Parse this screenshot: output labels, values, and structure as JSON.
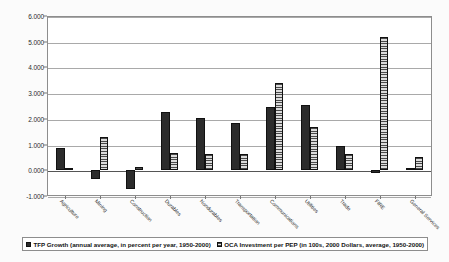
{
  "chart_data": {
    "type": "bar",
    "title": "",
    "subtitle": "",
    "xlabel": "",
    "ylabel": "",
    "ylim": [
      -1.0,
      6.0
    ],
    "ytick_values": [
      6.0,
      5.0,
      4.0,
      3.0,
      2.0,
      1.0,
      0.0,
      -1.0
    ],
    "ytick_labels": [
      "6.000",
      "5.000",
      "4.000",
      "3.000",
      "2.000",
      "1.000",
      "0.000",
      "-1.000"
    ],
    "grid": true,
    "legend_position": "bottom",
    "categories": [
      "Agriculture",
      "Mining",
      "Construction",
      "Durables",
      "Nondurables",
      "Transportation",
      "Communications",
      "Utilities",
      "Trade",
      "FIRE",
      "General Services"
    ],
    "series": [
      {
        "name": "TFP Growth (annual average, in percent per year, 1950-2000)",
        "key": "tfp",
        "color": "#2c2c2c",
        "values": [
          0.88,
          -0.34,
          -0.72,
          2.28,
          2.05,
          1.84,
          2.48,
          2.55,
          0.94,
          -0.1,
          0.09
        ]
      },
      {
        "name": "OCA Investment per PEP (in 100s, 2000 Dollars, average, 1950-2000)",
        "key": "oca",
        "color": "#c9c9c9",
        "values": [
          0.05,
          1.31,
          0.11,
          0.67,
          0.64,
          0.65,
          3.38,
          1.69,
          0.65,
          5.18,
          0.53
        ]
      }
    ]
  },
  "legend": {
    "items": [
      {
        "label": "TFP Growth (annual average, in percent per year, 1950-2000)",
        "swatch": "tfp"
      },
      {
        "label": "OCA Investment per PEP (in 100s, 2000 Dollars, average, 1950-2000)",
        "swatch": "oca"
      }
    ]
  }
}
